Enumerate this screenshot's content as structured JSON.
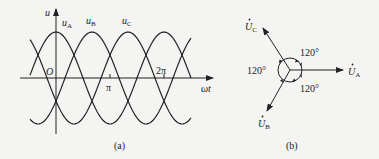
{
  "figure_a": {
    "caption": "(a)",
    "y_axis_label": "u",
    "x_axis_label": "ωt",
    "origin_label": "O",
    "ticks": [
      {
        "label": "π",
        "position": 1
      },
      {
        "label": "2π",
        "position": 2
      }
    ],
    "waves": [
      {
        "name": "uA",
        "label_main": "u",
        "label_sub": "A",
        "phase_deg": 0
      },
      {
        "name": "uB",
        "label_main": "u",
        "label_sub": "B",
        "phase_deg": -120
      },
      {
        "name": "uC",
        "label_main": "u",
        "label_sub": "C",
        "phase_deg": 120
      }
    ]
  },
  "figure_b": {
    "caption": "(b)",
    "phasors": [
      {
        "name": "UA",
        "label_main": "U",
        "label_sub": "A",
        "angle_deg": 0
      },
      {
        "name": "UB",
        "label_main": "U",
        "label_sub": "B",
        "angle_deg": -120
      },
      {
        "name": "UC",
        "label_main": "U",
        "label_sub": "C",
        "angle_deg": 120
      }
    ],
    "angle_labels": [
      "120°",
      "120°",
      "120°"
    ]
  },
  "colors": {
    "line": "#222222",
    "background": "#f4f4f2"
  }
}
